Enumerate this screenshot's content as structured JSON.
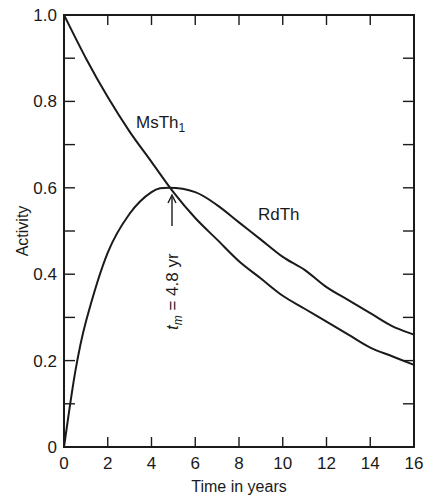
{
  "chart_data": {
    "type": "line",
    "title": "",
    "xlabel": "Time in years",
    "ylabel": "Activity",
    "xlim": [
      0,
      16
    ],
    "ylim": [
      0,
      1.0
    ],
    "grid": false,
    "x_ticks": [
      "0",
      "2",
      "4",
      "6",
      "8",
      "10",
      "12",
      "14",
      "16"
    ],
    "y_ticks": [
      "0",
      "0.2",
      "0.4",
      "0.6",
      "0.8",
      "1.0"
    ],
    "series": [
      {
        "name": "MsTh1",
        "label": "MsTh",
        "label_subscript": "1",
        "x": [
          0,
          1,
          2,
          3,
          4,
          5,
          6,
          7,
          8,
          9,
          10,
          11,
          12,
          13,
          14,
          15,
          16
        ],
        "values": [
          1.0,
          0.9,
          0.81,
          0.73,
          0.66,
          0.59,
          0.53,
          0.48,
          0.43,
          0.39,
          0.35,
          0.32,
          0.29,
          0.26,
          0.23,
          0.21,
          0.19
        ]
      },
      {
        "name": "RdTh",
        "label": "RdTh",
        "x": [
          0,
          0.5,
          1,
          2,
          3,
          4,
          4.8,
          6,
          7,
          8,
          9,
          10,
          11,
          12,
          13,
          14,
          15,
          16
        ],
        "values": [
          0,
          0.17,
          0.29,
          0.45,
          0.54,
          0.59,
          0.6,
          0.59,
          0.56,
          0.52,
          0.48,
          0.44,
          0.41,
          0.37,
          0.34,
          0.31,
          0.28,
          0.26
        ]
      }
    ],
    "annotations": [
      {
        "text_prefix": "t",
        "text_subscript": "m",
        "text_suffix": " = 4.8 yr",
        "x": 4.8,
        "y": 0.6,
        "arrow": "up",
        "rotation": -90
      }
    ]
  }
}
